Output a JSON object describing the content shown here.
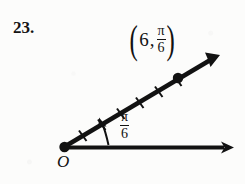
{
  "problem": {
    "number": "23."
  },
  "figure": {
    "type": "polar-coordinate-diagram",
    "origin_label": "O",
    "point_label": {
      "open_paren": "(",
      "radius": "6",
      "comma": ",",
      "angle_numerator": "π",
      "angle_denominator": "6",
      "close_paren": ")"
    },
    "angle_label": {
      "numerator": "π",
      "denominator": "6"
    },
    "geometry": {
      "origin": [
        64,
        147
      ],
      "point": [
        178,
        78
      ],
      "ray_tip": [
        219,
        56
      ],
      "axis_tip": [
        232,
        148
      ],
      "tick_count": 6,
      "angle_degrees": 31
    },
    "colors": {
      "ink": "#121212",
      "background": "#fcfcfb"
    }
  }
}
